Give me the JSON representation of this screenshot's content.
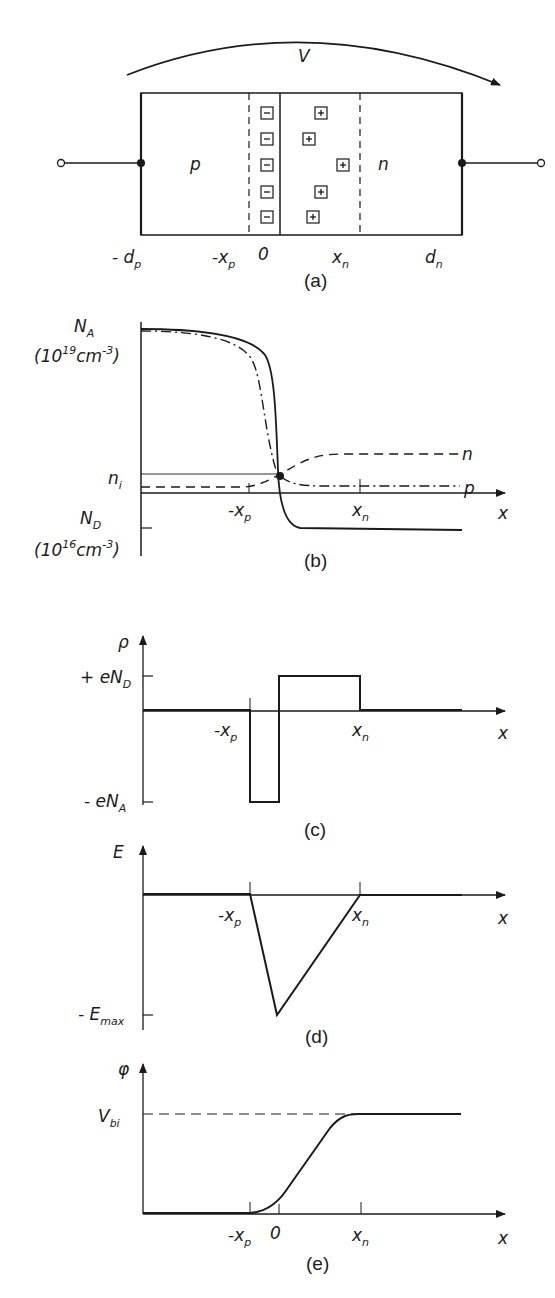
{
  "colors": {
    "ink": "#1a1a1a",
    "background": "#ffffff"
  },
  "panel_a": {
    "caption": "(a)",
    "voltage_label": "V",
    "region_p": "p",
    "region_n": "n",
    "positions": {
      "minus_dp": "- d",
      "minus_dp_sub": "p",
      "minus_xp": "-x",
      "minus_xp_sub": "p",
      "zero": "0",
      "xn": "x",
      "xn_sub": "n",
      "dn": "d",
      "dn_sub": "n"
    },
    "negative_ions": [
      "−",
      "−",
      "−",
      "−",
      "−"
    ],
    "positive_ions": [
      "+",
      "+",
      "+",
      "+",
      "+"
    ]
  },
  "panel_b": {
    "caption": "(b)",
    "y_label_top": "N",
    "y_label_top_sub": "A",
    "y_unit_top": "(10",
    "y_unit_top_exp": "19",
    "y_unit_top_rest": "cm",
    "y_unit_top_exp2": "-3",
    "y_unit_top_close": ")",
    "ni_label": "n",
    "ni_sub": "i",
    "y_label_bottom": "N",
    "y_label_bottom_sub": "D",
    "y_unit_bottom": "(10",
    "y_unit_bottom_exp": "16",
    "y_unit_bottom_rest": "cm",
    "y_unit_bottom_exp2": "-3",
    "y_unit_bottom_close": ")",
    "x_tick_xp": "-x",
    "x_tick_xp_sub": "p",
    "x_tick_xn": "x",
    "x_tick_xn_sub": "n",
    "x_axis": "x",
    "curve_n_label": "n",
    "curve_p_label": "p"
  },
  "panel_c": {
    "caption": "(c)",
    "y_axis": "ρ",
    "pos_level": "+ eN",
    "pos_level_sub": "D",
    "neg_level": "- eN",
    "neg_level_sub": "A",
    "x_tick_xp": "-x",
    "x_tick_xp_sub": "p",
    "x_tick_xn": "x",
    "x_tick_xn_sub": "n",
    "x_axis": "x"
  },
  "panel_d": {
    "caption": "(d)",
    "y_axis": "E",
    "min_level": "- E",
    "min_level_sub": "max",
    "x_tick_xp": "-x",
    "x_tick_xp_sub": "p",
    "x_tick_xn": "x",
    "x_tick_xn_sub": "n",
    "x_axis": "x"
  },
  "panel_e": {
    "caption": "(e)",
    "y_axis": "φ",
    "level": "V",
    "level_sub": "bi",
    "x_tick_xp": "-x",
    "x_tick_xp_sub": "p",
    "x_tick_zero": "0",
    "x_tick_xn": "x",
    "x_tick_xn_sub": "n",
    "x_axis": "x"
  }
}
